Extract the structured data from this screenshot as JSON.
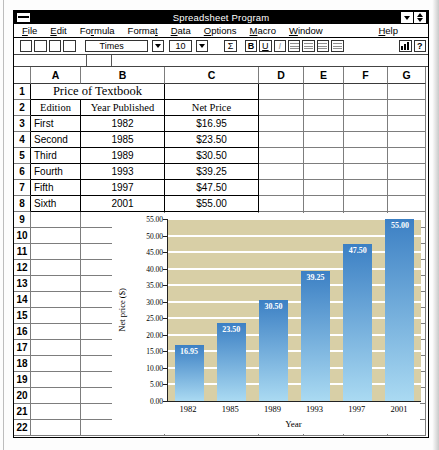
{
  "window": {
    "title": "Spreadsheet Program",
    "left_icon": "control-menu-icon",
    "right_icons": [
      "down-arrow-icon",
      "up-down-arrow-icon"
    ]
  },
  "menu": {
    "items": [
      {
        "label": "File",
        "u": 0
      },
      {
        "label": "Edit",
        "u": 0
      },
      {
        "label": "Formula",
        "u": 2
      },
      {
        "label": "Format",
        "u": 5
      },
      {
        "label": "Data",
        "u": 0
      },
      {
        "label": "Options",
        "u": 0
      },
      {
        "label": "Macro",
        "u": 0
      },
      {
        "label": "Window",
        "u": 0
      },
      {
        "label": "Help",
        "u": 0,
        "right": true
      }
    ]
  },
  "toolbar": {
    "blank_buttons": 4,
    "font_name": "Times",
    "font_size": "10",
    "sum_label": "Σ",
    "bold_label": "B",
    "underline_label": "U",
    "italic_label": "I",
    "align_icons": [
      "align-left-icon",
      "align-center-icon",
      "align-right-icon",
      "align-justify-icon"
    ],
    "chart_icon": "bar-chart-icon",
    "help_label": "?"
  },
  "formula_bar": {
    "value": ""
  },
  "grid": {
    "column_headers": [
      "A",
      "B",
      "C",
      "D",
      "E",
      "F",
      "G"
    ],
    "rows_total": 22,
    "title_cell": {
      "row": 1,
      "span": "A:B",
      "text": "Price of Textbook"
    },
    "header_cells": {
      "row": 2,
      "a": "Edition",
      "b": "Year Published",
      "c": "Net Price"
    },
    "data_rows": [
      {
        "row": 3,
        "edition": "First",
        "year": "1982",
        "price": "$16.95"
      },
      {
        "row": 4,
        "edition": "Second",
        "year": "1985",
        "price": "$23.50"
      },
      {
        "row": 5,
        "edition": "Third",
        "year": "1989",
        "price": "$30.50"
      },
      {
        "row": 6,
        "edition": "Fourth",
        "year": "1993",
        "price": "$39.25"
      },
      {
        "row": 7,
        "edition": "Fifth",
        "year": "1997",
        "price": "$47.50"
      },
      {
        "row": 8,
        "edition": "Sixth",
        "year": "2001",
        "price": "$55.00"
      }
    ]
  },
  "chart_data": {
    "type": "bar",
    "categories": [
      "1982",
      "1985",
      "1989",
      "1993",
      "1997",
      "2001"
    ],
    "values": [
      16.95,
      23.5,
      30.5,
      39.25,
      47.5,
      55
    ],
    "bar_labels": [
      "16.95",
      "23.50",
      "30.50",
      "39.25",
      "47.50",
      "55.00"
    ],
    "xlabel": "Year",
    "ylabel": "Net price ($)",
    "ylim": [
      0,
      55
    ],
    "ytick_step": 5,
    "ytick_labels": [
      "0.00",
      "5.00",
      "10.00",
      "15.00",
      "20.00",
      "25.00",
      "30.00",
      "35.00",
      "40.00",
      "45.00",
      "50.00",
      "55.00"
    ],
    "legend": "none",
    "grid": "horizontal-white",
    "plot_bg_color": "#d8cfa6",
    "bar_color_top": "#3c80c4",
    "bar_color_bottom": "#aadaf2",
    "bar_label_color": "#ffffff"
  }
}
